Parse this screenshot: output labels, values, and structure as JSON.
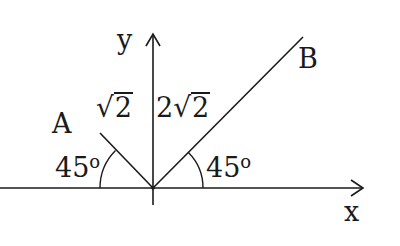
{
  "figure": {
    "axes": {
      "x_label": "x",
      "y_label": "y"
    },
    "vectors": [
      {
        "name": "A",
        "magnitude_label_coef": "",
        "magnitude_label_radicand": "2",
        "angle_label": "45",
        "angle_unit": "o",
        "side": "left"
      },
      {
        "name": "B",
        "magnitude_label_coef": "2",
        "magnitude_label_radicand": "2",
        "angle_label": "45",
        "angle_unit": "o",
        "side": "right"
      }
    ],
    "radical_symbol": "√",
    "colors": {
      "ink": "#1a1a1a",
      "background": "#ffffff"
    }
  }
}
